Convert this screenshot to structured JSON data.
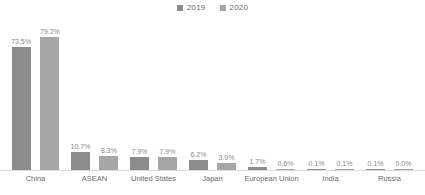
{
  "chart_data": {
    "type": "bar",
    "title": "",
    "subtitle": "",
    "xlabel": "",
    "ylabel": "",
    "ylim": [
      0,
      100
    ],
    "grid": false,
    "legend_position": "top-center",
    "value_suffix": "%",
    "categories": [
      "China",
      "ASEAN",
      "United States",
      "Japan",
      "European Union",
      "India",
      "Russia"
    ],
    "series": [
      {
        "name": "2019",
        "color": "#8c8c8c",
        "values": [
          73.5,
          10.7,
          7.9,
          6.2,
          1.7,
          0.1,
          0.1
        ],
        "labels": [
          "73.5%",
          "10.7%",
          "7.9%",
          "6.2%",
          "1.7%",
          "0.1%",
          "0.1%"
        ]
      },
      {
        "name": "2020",
        "color": "#a6a6a6",
        "values": [
          79.2,
          8.3,
          7.9,
          3.9,
          0.6,
          0.1,
          0.0
        ],
        "labels": [
          "79.2%",
          "8.3%",
          "7.9%",
          "3.9%",
          "0.6%",
          "0.1%",
          "0.0%"
        ]
      }
    ]
  },
  "legend": {
    "items": [
      {
        "label": "2019",
        "color": "#8c8c8c"
      },
      {
        "label": "2020",
        "color": "#a6a6a6"
      }
    ]
  }
}
